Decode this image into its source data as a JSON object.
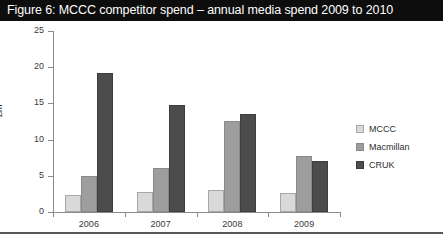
{
  "figure": {
    "title": "Figure 6: MCCC competitor spend – annual media spend 2009 to 2010"
  },
  "chart_data": {
    "type": "bar",
    "title": "Figure 6: MCCC competitor spend – annual media spend 2009 to 2010",
    "xlabel": "",
    "ylabel": "£m",
    "categories": [
      "2006",
      "2007",
      "2008",
      "2009"
    ],
    "series": [
      {
        "name": "MCCC",
        "color": "#d9d9d9",
        "values": [
          2.3,
          2.8,
          3.0,
          2.6
        ]
      },
      {
        "name": "Macmillan",
        "color": "#9e9e9e",
        "values": [
          5.0,
          6.1,
          12.6,
          7.7
        ]
      },
      {
        "name": "CRUK",
        "color": "#4c4c4c",
        "values": [
          19.2,
          14.8,
          13.5,
          7.0
        ]
      }
    ],
    "ylim": [
      0,
      25
    ],
    "yticks": [
      0,
      5,
      10,
      15,
      20,
      25
    ],
    "ytick_labels": [
      "0",
      "5",
      "10",
      "15",
      "20",
      "25"
    ],
    "grid": false,
    "legend_position": "right"
  }
}
